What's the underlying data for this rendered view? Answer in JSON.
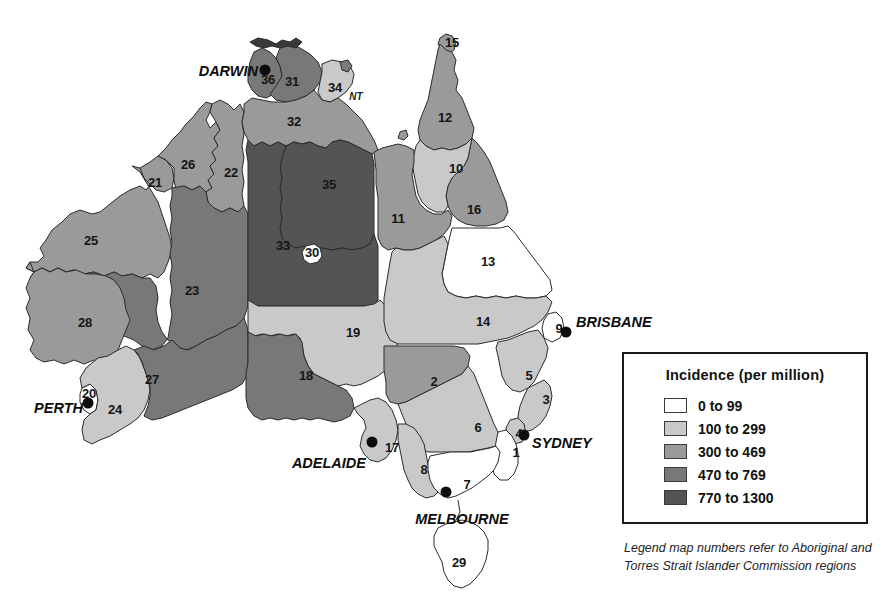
{
  "legend": {
    "title": "Incidence (per million)",
    "note": "Legend map numbers refer to Aboriginal and Torres Strait Islander Commission regions",
    "classes": [
      {
        "label": "0 to 99",
        "color": "#ffffff",
        "min": 0,
        "max": 99
      },
      {
        "label": "100 to 299",
        "color": "#c9c9c9",
        "min": 100,
        "max": 299
      },
      {
        "label": "300 to 469",
        "color": "#9a9a9a",
        "min": 300,
        "max": 469
      },
      {
        "label": "470 to 769",
        "color": "#787878",
        "min": 470,
        "max": 769
      },
      {
        "label": "770 to 1300",
        "color": "#545454",
        "min": 770,
        "max": 1300
      }
    ]
  },
  "map": {
    "title": "Australia",
    "outline_color": "#2b2b2b",
    "cities": [
      {
        "name": "DARWIN",
        "dot_x": 265,
        "dot_y": 70,
        "label_x": 258,
        "label_y": 71,
        "anchor": "left"
      },
      {
        "name": "BRISBANE",
        "dot_x": 566,
        "dot_y": 332,
        "label_x": 576,
        "label_y": 322,
        "anchor": "right"
      },
      {
        "name": "SYDNEY",
        "dot_x": 524,
        "dot_y": 435,
        "label_x": 532,
        "label_y": 443,
        "anchor": "right"
      },
      {
        "name": "MELBOURNE",
        "dot_x": 446,
        "dot_y": 492,
        "label_x": 462,
        "label_y": 512,
        "anchor": "below"
      },
      {
        "name": "ADELAIDE",
        "dot_x": 372,
        "dot_y": 442,
        "label_x": 366,
        "label_y": 463,
        "anchor": "left"
      },
      {
        "name": "PERTH",
        "dot_x": 88,
        "dot_y": 403,
        "label_x": 83,
        "label_y": 408,
        "anchor": "left"
      }
    ],
    "state_abbrevs": [
      {
        "text": "NT",
        "x": 356,
        "y": 96
      }
    ],
    "regions": [
      {
        "id": "1",
        "label": "1",
        "class_index": 0,
        "label_x": 516,
        "label_y": 452
      },
      {
        "id": "2",
        "label": "2",
        "class_index": 2,
        "label_x": 434,
        "label_y": 381
      },
      {
        "id": "3",
        "label": "3",
        "class_index": 1,
        "label_x": 546,
        "label_y": 399
      },
      {
        "id": "4",
        "label": "4",
        "class_index": 1,
        "label_x": 519,
        "label_y": 433
      },
      {
        "id": "5",
        "label": "5",
        "class_index": 1,
        "label_x": 529,
        "label_y": 375
      },
      {
        "id": "6",
        "label": "6",
        "class_index": 1,
        "label_x": 478,
        "label_y": 427
      },
      {
        "id": "7",
        "label": "7",
        "class_index": 0,
        "label_x": 467,
        "label_y": 484
      },
      {
        "id": "8",
        "label": "8",
        "class_index": 1,
        "label_x": 424,
        "label_y": 469
      },
      {
        "id": "9",
        "label": "9",
        "class_index": 0,
        "label_x": 559,
        "label_y": 328
      },
      {
        "id": "10",
        "label": "10",
        "class_index": 1,
        "label_x": 456,
        "label_y": 168
      },
      {
        "id": "11",
        "label": "11",
        "class_index": 2,
        "label_x": 398,
        "label_y": 218
      },
      {
        "id": "12",
        "label": "12",
        "class_index": 2,
        "label_x": 445,
        "label_y": 117
      },
      {
        "id": "13",
        "label": "13",
        "class_index": 0,
        "label_x": 488,
        "label_y": 261
      },
      {
        "id": "14",
        "label": "14",
        "class_index": 1,
        "label_x": 483,
        "label_y": 321
      },
      {
        "id": "15",
        "label": "15",
        "class_index": 2,
        "label_x": 452,
        "label_y": 42
      },
      {
        "id": "16",
        "label": "16",
        "class_index": 2,
        "label_x": 474,
        "label_y": 209
      },
      {
        "id": "17",
        "label": "17",
        "class_index": 1,
        "label_x": 392,
        "label_y": 447
      },
      {
        "id": "18",
        "label": "18",
        "class_index": 3,
        "label_x": 306,
        "label_y": 375
      },
      {
        "id": "19",
        "label": "19",
        "class_index": 1,
        "label_x": 353,
        "label_y": 332
      },
      {
        "id": "20",
        "label": "20",
        "class_index": 0,
        "label_x": 89,
        "label_y": 393
      },
      {
        "id": "21",
        "label": "21",
        "class_index": 2,
        "label_x": 155,
        "label_y": 182
      },
      {
        "id": "22",
        "label": "22",
        "class_index": 2,
        "label_x": 231,
        "label_y": 172
      },
      {
        "id": "23",
        "label": "23",
        "class_index": 3,
        "label_x": 192,
        "label_y": 290
      },
      {
        "id": "24",
        "label": "24",
        "class_index": 1,
        "label_x": 115,
        "label_y": 409
      },
      {
        "id": "25",
        "label": "25",
        "class_index": 2,
        "label_x": 91,
        "label_y": 240
      },
      {
        "id": "26",
        "label": "26",
        "class_index": 2,
        "label_x": 188,
        "label_y": 164
      },
      {
        "id": "27",
        "label": "27",
        "class_index": 3,
        "label_x": 152,
        "label_y": 379
      },
      {
        "id": "28",
        "label": "28",
        "class_index": 2,
        "label_x": 85,
        "label_y": 322
      },
      {
        "id": "29",
        "label": "29",
        "class_index": 0,
        "label_x": 459,
        "label_y": 562
      },
      {
        "id": "30",
        "label": "30",
        "class_index": 0,
        "label_x": 312,
        "label_y": 252
      },
      {
        "id": "31",
        "label": "31",
        "class_index": 3,
        "label_x": 292,
        "label_y": 81
      },
      {
        "id": "32",
        "label": "32",
        "class_index": 2,
        "label_x": 294,
        "label_y": 121
      },
      {
        "id": "33",
        "label": "33",
        "class_index": 4,
        "label_x": 283,
        "label_y": 245
      },
      {
        "id": "34",
        "label": "34",
        "class_index": 1,
        "label_x": 335,
        "label_y": 87
      },
      {
        "id": "35",
        "label": "35",
        "class_index": 4,
        "label_x": 329,
        "label_y": 184
      },
      {
        "id": "36",
        "label": "36",
        "class_index": 3,
        "label_x": 268,
        "label_y": 79
      }
    ]
  }
}
